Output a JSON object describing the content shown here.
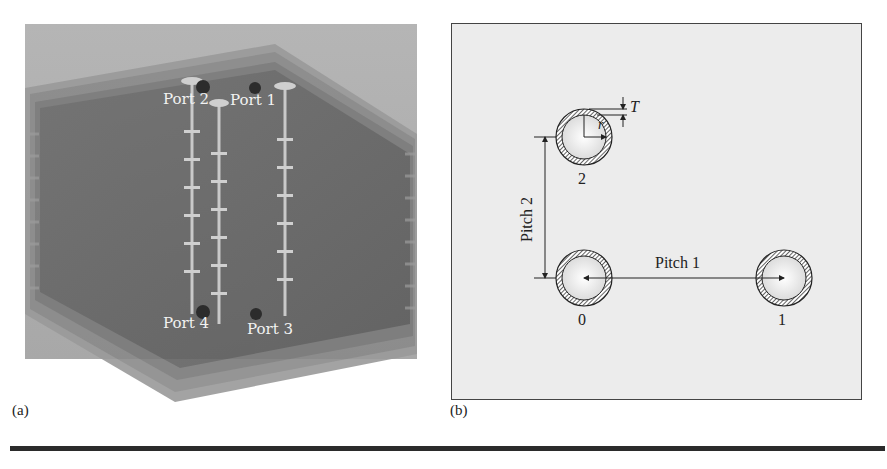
{
  "figure": {
    "panels": [
      {
        "id": "a",
        "label": "(a)",
        "description": "3D view of multilayer board with four via columns",
        "ports": [
          {
            "label": "Port 2"
          },
          {
            "label": "Port 1"
          },
          {
            "label": "Port 4"
          },
          {
            "label": "Port 3"
          }
        ]
      },
      {
        "id": "b",
        "label": "(b)",
        "description": "Top-view via arrangement",
        "vias": [
          {
            "label": "2"
          },
          {
            "label": "0"
          },
          {
            "label": "1"
          }
        ],
        "dimensions": {
          "pitch1": "Pitch 1",
          "pitch2": "Pitch 2",
          "radius": "r",
          "thickness": "T"
        }
      }
    ],
    "colors": {
      "board_dark": "#5a5a5a",
      "board_light": "#bdbdbd",
      "diagram_bg": "#ececec",
      "line": "#222222"
    }
  }
}
